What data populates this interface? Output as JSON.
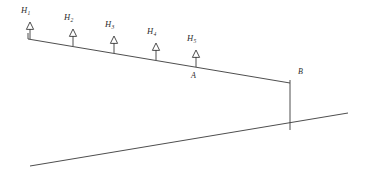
{
  "figure": {
    "name": "sloped-beam-with-vertical-loads",
    "background_color": "#ffffff",
    "line_color": "#3a3a3a",
    "text_color": "#2b2b2b"
  },
  "loads": [
    {
      "id": "H1",
      "base": "H",
      "subscript": "1",
      "label": "H1",
      "arrow_x": 30,
      "arrow_tip_y": 22,
      "arrow_base_y": 39,
      "label_x": 21,
      "label_y": 6
    },
    {
      "id": "H2",
      "base": "H",
      "subscript": "2",
      "label": "H2",
      "arrow_x": 73,
      "arrow_tip_y": 29,
      "arrow_base_y": 46,
      "label_x": 64,
      "label_y": 13
    },
    {
      "id": "H3",
      "base": "H",
      "subscript": "3",
      "label": "H3",
      "arrow_x": 114,
      "arrow_tip_y": 36,
      "arrow_base_y": 53,
      "label_x": 105,
      "label_y": 20
    },
    {
      "id": "H4",
      "base": "H",
      "subscript": "4",
      "label": "H4",
      "arrow_x": 156,
      "arrow_tip_y": 43,
      "arrow_base_y": 60,
      "label_x": 147,
      "label_y": 27
    },
    {
      "id": "H5",
      "base": "H",
      "subscript": "5",
      "label": "H5",
      "arrow_x": 196,
      "arrow_tip_y": 50,
      "arrow_base_y": 67,
      "label_x": 187,
      "label_y": 34
    }
  ],
  "points": [
    {
      "id": "A",
      "label": "A",
      "x": 191,
      "y": 72
    },
    {
      "id": "B",
      "label": "B",
      "x": 298,
      "y": 68
    }
  ],
  "geometry": {
    "beam": {
      "x1": 28,
      "y1": 39,
      "x2": 290,
      "y2": 83
    },
    "left_stub": {
      "x1": 28,
      "y1": 33,
      "x2": 28,
      "y2": 39
    },
    "column": {
      "x1": 290,
      "y1": 80,
      "x2": 290,
      "y2": 130
    },
    "ground": {
      "x1": 30,
      "y1": 166,
      "x2": 348,
      "y2": 113
    }
  }
}
